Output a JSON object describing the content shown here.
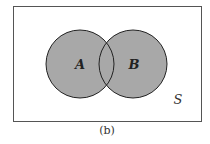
{
  "diagram": {
    "type": "venn",
    "universe": {
      "label": "S",
      "x": 13,
      "y": 6,
      "width": 188,
      "height": 115,
      "stroke": "#555555",
      "fill": "#ffffff"
    },
    "sets": [
      {
        "label": "A",
        "cx": 80,
        "cy": 64,
        "r": 34,
        "fill": "#a8a8a8",
        "stroke": "#222222"
      },
      {
        "label": "B",
        "cx": 133,
        "cy": 64,
        "r": 34,
        "fill": "#a8a8a8",
        "stroke": "#222222"
      }
    ],
    "shaded_region": "A ∪ B",
    "caption": "(b)"
  }
}
